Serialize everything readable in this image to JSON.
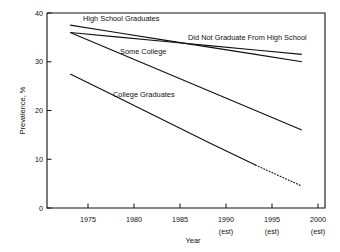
{
  "chart_data": {
    "type": "line",
    "title": "",
    "xlabel": "Year",
    "ylabel": "Prevalence, %",
    "x": [
      1975,
      1980,
      1985,
      1990,
      1995,
      2000
    ],
    "xtick_labels": [
      "1975",
      "1980",
      "1985",
      "1990",
      "1995",
      "2000"
    ],
    "xtick_sublabels": [
      "",
      "",
      "",
      "(est)",
      "(est)",
      "(est)"
    ],
    "ytick_labels": [
      "0",
      "10",
      "20",
      "30",
      "40"
    ],
    "ytick_values": [
      0,
      10,
      20,
      30,
      40
    ],
    "xlim": [
      1972.5,
      2002.5
    ],
    "ylim": [
      0,
      40
    ],
    "grid": false,
    "legend_position": "inline-annotations",
    "series": [
      {
        "name": "High School Graduates",
        "label": "High School Graduates",
        "style": "solid",
        "values": [
          37.5,
          36.0,
          34.5,
          33.0,
          31.5,
          30.0
        ]
      },
      {
        "name": "Did Not Graduate From High School",
        "label": "Did Not Graduate From High School",
        "style": "solid",
        "values": [
          36.0,
          35.1,
          34.2,
          33.3,
          32.4,
          31.5
        ]
      },
      {
        "name": "Some College",
        "label": "Some College",
        "style": "solid",
        "values": [
          36.0,
          32.0,
          28.0,
          24.0,
          20.0,
          16.0
        ]
      },
      {
        "name": "College Graduates",
        "label": "College Graduates",
        "style": "solid-then-dotted",
        "dotted_from": 1995,
        "values": [
          27.5,
          22.8,
          18.1,
          13.4,
          8.8,
          4.5
        ]
      }
    ]
  },
  "annotations": {
    "high_school_graduates": "High School Graduates",
    "did_not_graduate": "Did Not Graduate From High School",
    "some_college": "Some College",
    "college_graduates": "College Graduates"
  },
  "axes": {
    "y_title": "Prevalence, %",
    "x_title": "Year",
    "y_0": "0",
    "y_10": "10",
    "y_20": "20",
    "y_30": "30",
    "y_40": "40",
    "x_1975": "1975",
    "x_1980": "1980",
    "x_1985": "1985",
    "x_1990": "1990",
    "x_1995": "1995",
    "x_2000": "2000",
    "est_1990": "(est)",
    "est_1995": "(est)",
    "est_2000": "(est)"
  }
}
